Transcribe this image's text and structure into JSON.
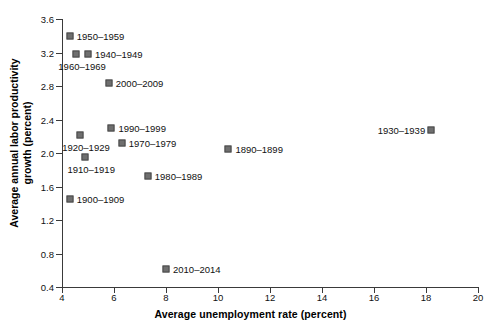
{
  "chart_data": {
    "type": "scatter",
    "title": "",
    "xlabel": "Average unemployment rate (percent)",
    "ylabel": "Average annual labor productivity growth (percent)",
    "ylabel_line1": "Average annual labor productivity",
    "ylabel_line2": "growth (percent)",
    "xlim": [
      4,
      20
    ],
    "ylim": [
      0.4,
      3.6
    ],
    "xticks": [
      4,
      6,
      8,
      10,
      12,
      14,
      16,
      18,
      20
    ],
    "yticks": [
      0.4,
      0.8,
      1.2,
      1.6,
      2.0,
      2.4,
      2.8,
      3.2,
      3.6
    ],
    "xticklabels": [
      "4",
      "6",
      "8",
      "10",
      "12",
      "14",
      "16",
      "18",
      "20"
    ],
    "yticklabels": [
      "0.4",
      "0.8",
      "1.2",
      "1.6",
      "2.0",
      "2.4",
      "2.8",
      "3.2",
      "3.6"
    ],
    "grid": false,
    "legend": "none",
    "marker_color": "#6f6f6f",
    "marker_edge_color": "#4a4a4a",
    "axis_color": "#3a3a3a",
    "points": [
      {
        "label": "1950–1959",
        "x": 4.3,
        "y": 3.4,
        "label_side": "right"
      },
      {
        "label": "1940–1949",
        "x": 5.0,
        "y": 3.18,
        "label_side": "right"
      },
      {
        "label": "1960–1969",
        "x": 4.55,
        "y": 3.18,
        "label_side": "below-left"
      },
      {
        "label": "2000–2009",
        "x": 5.8,
        "y": 2.83,
        "label_side": "right"
      },
      {
        "label": "1990–1999",
        "x": 5.9,
        "y": 2.3,
        "label_side": "right"
      },
      {
        "label": "1920–1929",
        "x": 4.7,
        "y": 2.22,
        "label_side": "below-left"
      },
      {
        "label": "1970–1979",
        "x": 6.3,
        "y": 2.12,
        "label_side": "right"
      },
      {
        "label": "1910–1919",
        "x": 4.9,
        "y": 1.95,
        "label_side": "below-left"
      },
      {
        "label": "1930–1939",
        "x": 18.2,
        "y": 2.28,
        "label_side": "left"
      },
      {
        "label": "1890–1899",
        "x": 10.4,
        "y": 2.05,
        "label_side": "right"
      },
      {
        "label": "1980–1989",
        "x": 7.3,
        "y": 1.73,
        "label_side": "right"
      },
      {
        "label": "1900–1909",
        "x": 4.3,
        "y": 1.45,
        "label_side": "right"
      },
      {
        "label": "2010–2014",
        "x": 8.0,
        "y": 0.62,
        "label_side": "right"
      }
    ]
  }
}
